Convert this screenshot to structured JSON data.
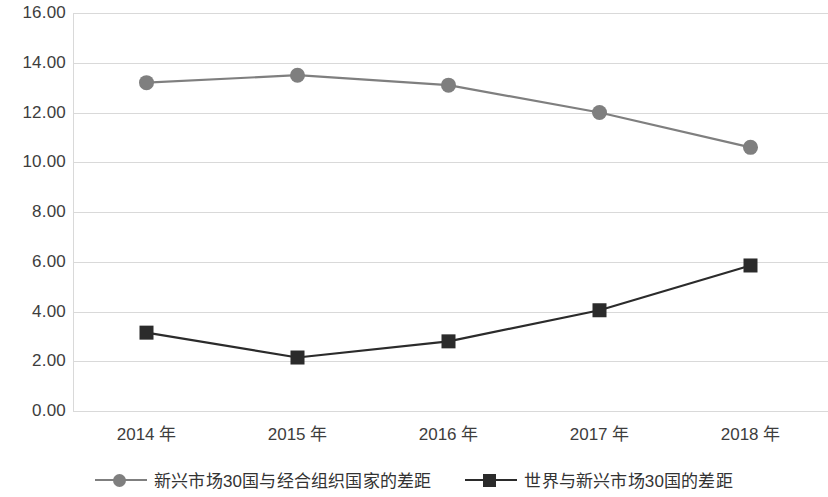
{
  "chart_data": {
    "type": "line",
    "title": "",
    "xlabel": "",
    "ylabel": "",
    "categories": [
      "2014 年",
      "2015 年",
      "2016 年",
      "2017 年",
      "2018 年"
    ],
    "ylim": [
      0,
      16
    ],
    "ytick_step": 2,
    "ytick_labels": [
      "16.00",
      "14.00",
      "12.00",
      "10.00",
      "8.00",
      "6.00",
      "4.00",
      "2.00",
      "0.00"
    ],
    "ytick_values": [
      16,
      14,
      12,
      10,
      8,
      6,
      4,
      2,
      0
    ],
    "grid": true,
    "legend_position": "bottom",
    "series": [
      {
        "name": "新兴市场30国与经合组织国家的差距",
        "marker": "circle",
        "color": "#7f7f7f",
        "values": [
          13.2,
          13.5,
          13.1,
          12.0,
          10.6
        ]
      },
      {
        "name": "世界与新兴市场30国的差距",
        "marker": "square",
        "color": "#2b2b2b",
        "values": [
          3.15,
          2.15,
          2.8,
          4.05,
          5.85
        ]
      }
    ]
  },
  "legend": {
    "items": [
      {
        "label": "新兴市场30国与经合组织国家的差距",
        "marker": "circle-marker",
        "color": "#7f7f7f"
      },
      {
        "label": "世界与新兴市场30国的差距",
        "marker": "square-marker",
        "color": "#2b2b2b"
      }
    ]
  },
  "colors": {
    "gridline": "#d9d9d9",
    "series_1": "#7f7f7f",
    "series_2": "#2b2b2b",
    "text": "#3d3d3d",
    "background": "#ffffff"
  }
}
